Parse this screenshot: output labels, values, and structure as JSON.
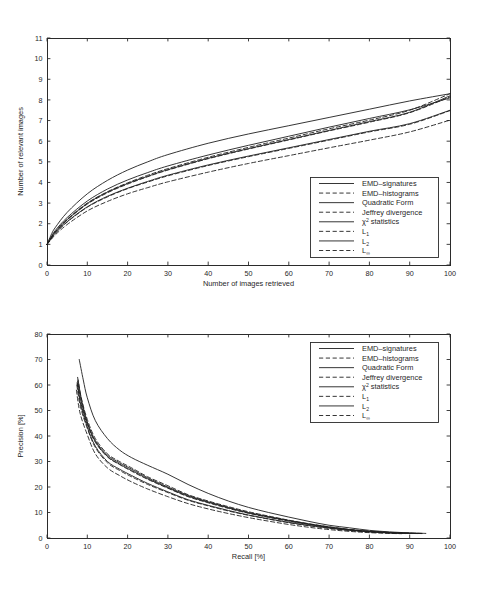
{
  "figure": {
    "background": "#ffffff",
    "line_color": "#1f1f1f",
    "axis_color": "#2b2b2b"
  },
  "charts": [
    {
      "id": "relevant-images-chart",
      "xlabel": "Number of images retrieved",
      "ylabel": "Number of relevant images",
      "xticks": [
        "0",
        "10",
        "20",
        "30",
        "40",
        "50",
        "60",
        "70",
        "80",
        "90",
        "100"
      ],
      "yticks": [
        "0",
        "1",
        "2",
        "3",
        "4",
        "5",
        "6",
        "7",
        "8",
        "9",
        "10",
        "11"
      ],
      "legend_position": "bottom-right"
    },
    {
      "id": "precision-recall-chart",
      "xlabel": "Recall [%]",
      "ylabel": "Precision [%]",
      "xticks": [
        "0",
        "10",
        "20",
        "30",
        "40",
        "50",
        "60",
        "70",
        "80",
        "90",
        "100"
      ],
      "yticks": [
        "0",
        "10",
        "20",
        "30",
        "40",
        "50",
        "60",
        "70",
        "80"
      ],
      "legend_position": "top-right"
    }
  ],
  "legend": {
    "entries": [
      {
        "label": "EMD–signatures",
        "style": "solid",
        "width": 0.9
      },
      {
        "label": "EMD–histograms",
        "style": "dashed",
        "width": 0.9
      },
      {
        "label": "Quadratic Form",
        "style": "solid",
        "width": 0.9
      },
      {
        "label": "Jeffrey divergence",
        "style": "dashed",
        "width": 0.9
      },
      {
        "label": "χ² statistics",
        "style": "solid",
        "width": 0.9,
        "base": "χ",
        "sup": "2",
        "rest": " statistics"
      },
      {
        "label": "L₁",
        "style": "dashed",
        "width": 0.9,
        "base": "L",
        "sub": "1"
      },
      {
        "label": "L₂",
        "style": "solid",
        "width": 0.9,
        "base": "L",
        "sub": "2"
      },
      {
        "label": "L∞",
        "style": "dashed",
        "width": 0.9,
        "base": "L",
        "sub": "∞"
      }
    ]
  },
  "chart_data": [
    {
      "type": "line",
      "id": "relevant-images-chart",
      "title": "",
      "xlabel": "Number of images retrieved",
      "ylabel": "Number of relevant images",
      "xlim": [
        0,
        100
      ],
      "ylim": [
        0,
        11
      ],
      "xticks": [
        0,
        10,
        20,
        30,
        40,
        50,
        60,
        70,
        80,
        90,
        100
      ],
      "yticks": [
        0,
        1,
        2,
        3,
        4,
        5,
        6,
        7,
        8,
        9,
        10,
        11
      ],
      "grid": false,
      "legend_position": "lower right",
      "x": [
        0,
        1,
        2,
        5,
        10,
        15,
        20,
        25,
        30,
        40,
        50,
        60,
        70,
        80,
        90,
        100
      ],
      "series": [
        {
          "name": "EMD–signatures",
          "style": "solid",
          "values": [
            1.0,
            1.45,
            1.8,
            2.55,
            3.45,
            4.1,
            4.6,
            5.0,
            5.35,
            5.9,
            6.35,
            6.75,
            7.15,
            7.55,
            7.95,
            8.3
          ]
        },
        {
          "name": "EMD–histograms",
          "style": "dashed",
          "values": [
            1.0,
            1.32,
            1.6,
            2.22,
            3.0,
            3.55,
            3.98,
            4.35,
            4.67,
            5.22,
            5.7,
            6.15,
            6.6,
            7.02,
            7.5,
            8.3
          ]
        },
        {
          "name": "Quadratic Form",
          "style": "solid",
          "values": [
            1.0,
            1.35,
            1.66,
            2.3,
            3.1,
            3.68,
            4.12,
            4.48,
            4.8,
            5.33,
            5.8,
            6.24,
            6.68,
            7.1,
            7.52,
            8.1
          ]
        },
        {
          "name": "Jeffrey divergence",
          "style": "dashed",
          "values": [
            1.0,
            1.3,
            1.58,
            2.18,
            2.95,
            3.5,
            3.92,
            4.28,
            4.6,
            5.15,
            5.62,
            6.06,
            6.5,
            6.92,
            7.38,
            8.15
          ]
        },
        {
          "name": "χ² statistics",
          "style": "solid",
          "values": [
            1.0,
            1.31,
            1.6,
            2.2,
            2.98,
            3.53,
            3.95,
            4.3,
            4.62,
            5.17,
            5.64,
            6.08,
            6.52,
            6.95,
            7.4,
            8.2
          ]
        },
        {
          "name": "L₁",
          "style": "dashed",
          "values": [
            1.0,
            1.26,
            1.52,
            2.08,
            2.8,
            3.3,
            3.7,
            4.02,
            4.32,
            4.82,
            5.25,
            5.65,
            6.05,
            6.45,
            6.82,
            7.48
          ]
        },
        {
          "name": "L₂",
          "style": "solid",
          "values": [
            1.0,
            1.27,
            1.53,
            2.1,
            2.82,
            3.33,
            3.72,
            4.05,
            4.35,
            4.85,
            5.28,
            5.68,
            6.08,
            6.48,
            6.85,
            7.5
          ]
        },
        {
          "name": "L∞",
          "style": "dashed",
          "values": [
            1.0,
            1.22,
            1.45,
            1.96,
            2.62,
            3.08,
            3.45,
            3.75,
            4.03,
            4.5,
            4.92,
            5.3,
            5.68,
            6.05,
            6.45,
            7.02
          ]
        }
      ]
    },
    {
      "type": "line",
      "id": "precision-recall-chart",
      "title": "",
      "xlabel": "Recall [%]",
      "ylabel": "Precision [%]",
      "xlim": [
        0,
        100
      ],
      "ylim": [
        0,
        80
      ],
      "xticks": [
        0,
        10,
        20,
        30,
        40,
        50,
        60,
        70,
        80,
        90,
        100
      ],
      "yticks": [
        0,
        10,
        20,
        30,
        40,
        50,
        60,
        70,
        80
      ],
      "grid": false,
      "legend_position": "upper right",
      "series": [
        {
          "name": "EMD–signatures",
          "style": "solid",
          "x": [
            8,
            9,
            10,
            12,
            15,
            18,
            21,
            25,
            30,
            35,
            40,
            45,
            50,
            55,
            60,
            65,
            70,
            75,
            80,
            85,
            90,
            94
          ],
          "y": [
            70,
            62,
            55,
            46,
            39,
            34.5,
            31.5,
            28.5,
            25,
            21,
            17.5,
            14.5,
            12,
            10,
            8.2,
            6.5,
            5.0,
            4.0,
            3.0,
            2.4,
            2.0,
            1.8
          ]
        },
        {
          "name": "EMD–histograms",
          "style": "dashed",
          "x": [
            7.6,
            8.5,
            10,
            12,
            15,
            18,
            21,
            25,
            30,
            35,
            40,
            45,
            50,
            55,
            60,
            65,
            70,
            75,
            80,
            85,
            90,
            93
          ],
          "y": [
            63,
            55,
            46.5,
            39,
            33,
            30,
            27.5,
            24,
            20.5,
            17,
            14.5,
            12.3,
            10.3,
            8.6,
            7.0,
            5.6,
            4.4,
            3.4,
            2.7,
            2.2,
            1.9,
            1.8
          ]
        },
        {
          "name": "Quadratic Form",
          "style": "solid",
          "x": [
            7.7,
            8.6,
            10,
            12,
            15,
            18,
            21,
            25,
            30,
            35,
            40,
            45,
            50,
            55,
            60,
            65,
            70,
            75,
            80,
            85,
            90,
            93
          ],
          "y": [
            62,
            54,
            45.5,
            38.2,
            32.5,
            29.5,
            27,
            23.6,
            20,
            16.7,
            14.2,
            12.0,
            10.0,
            8.4,
            6.9,
            5.5,
            4.3,
            3.3,
            2.6,
            2.1,
            1.85,
            1.75
          ]
        },
        {
          "name": "Jeffrey divergence",
          "style": "dashed",
          "x": [
            7.5,
            8.4,
            10,
            12,
            15,
            18,
            21,
            25,
            30,
            35,
            40,
            45,
            50,
            55,
            60,
            65,
            70,
            75,
            80,
            85,
            90,
            92
          ],
          "y": [
            61,
            53,
            44.5,
            37.5,
            31.8,
            28.8,
            26.2,
            23.0,
            19.5,
            16.2,
            13.8,
            11.6,
            9.7,
            8.1,
            6.6,
            5.3,
            4.1,
            3.2,
            2.5,
            2.05,
            1.8,
            1.75
          ]
        },
        {
          "name": "χ² statistics",
          "style": "solid",
          "x": [
            7.6,
            8.5,
            10,
            12,
            15,
            18,
            21,
            25,
            30,
            35,
            40,
            45,
            50,
            55,
            60,
            65,
            70,
            75,
            80,
            85,
            90,
            93
          ],
          "y": [
            61.5,
            53.5,
            45,
            37.8,
            32,
            29,
            26.5,
            23.2,
            19.7,
            16.4,
            14.0,
            11.8,
            9.8,
            8.2,
            6.7,
            5.4,
            4.2,
            3.25,
            2.55,
            2.08,
            1.82,
            1.76
          ]
        },
        {
          "name": "L₁",
          "style": "dashed",
          "x": [
            7.4,
            8.3,
            10,
            12,
            15,
            18,
            21,
            25,
            30,
            35,
            40,
            45,
            50,
            55,
            60,
            65,
            70,
            75,
            80,
            85,
            89
          ],
          "y": [
            60,
            51.5,
            43,
            35.5,
            29.5,
            26.5,
            24,
            21,
            17.8,
            14.8,
            12.6,
            10.6,
            8.9,
            7.4,
            6.0,
            4.8,
            3.8,
            2.95,
            2.35,
            1.95,
            1.75
          ]
        },
        {
          "name": "L₂",
          "style": "solid",
          "x": [
            7.5,
            8.4,
            10,
            12,
            15,
            18,
            21,
            25,
            30,
            35,
            40,
            45,
            50,
            55,
            60,
            65,
            70,
            75,
            80,
            85,
            90
          ],
          "y": [
            60.5,
            52,
            43.5,
            36,
            30,
            27,
            24.5,
            21.4,
            18.1,
            15.0,
            12.8,
            10.8,
            9.0,
            7.5,
            6.1,
            4.9,
            3.85,
            3.0,
            2.4,
            1.98,
            1.78
          ]
        },
        {
          "name": "L∞",
          "style": "dashed",
          "x": [
            7.3,
            8.2,
            10,
            12,
            15,
            18,
            21,
            25,
            30,
            35,
            40,
            45,
            50,
            55,
            60,
            65,
            70,
            75,
            80,
            85,
            88
          ],
          "y": [
            58,
            49,
            40.5,
            33,
            27.5,
            24.5,
            22,
            19.2,
            16.2,
            13.5,
            11.4,
            9.6,
            8.0,
            6.6,
            5.3,
            4.2,
            3.3,
            2.6,
            2.1,
            1.8,
            1.7
          ]
        }
      ]
    }
  ]
}
